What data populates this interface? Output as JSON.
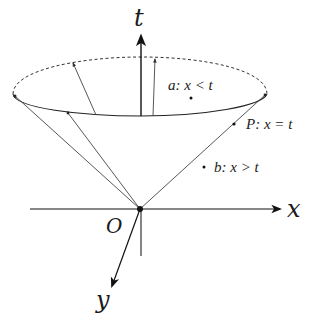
{
  "diagram": {
    "axes": {
      "t_label": "t",
      "x_label": "x",
      "y_label": "y",
      "origin_label": "O"
    },
    "points": [
      {
        "id": "a",
        "label": "a: x < t",
        "region": "inside cone"
      },
      {
        "id": "P",
        "label": "P: x = t",
        "region": "on cone surface"
      },
      {
        "id": "b",
        "label": "b: x > t",
        "region": "outside cone"
      }
    ],
    "colors": {
      "stroke": "#1a1a1a",
      "thin_stroke": "#555555",
      "background": "#ffffff"
    }
  }
}
